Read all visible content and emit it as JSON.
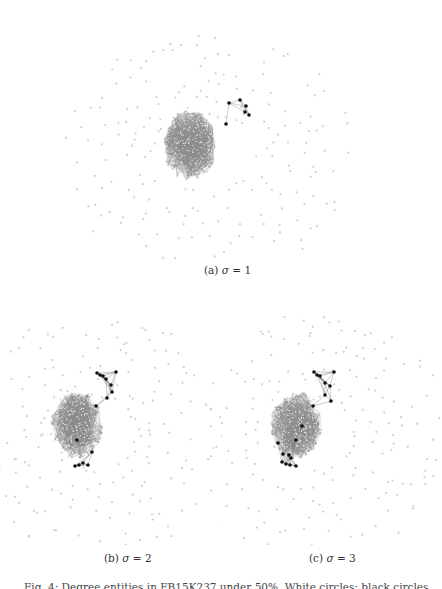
{
  "figure": {
    "caption_partial": "Fig. 4: Degree entities in FB15K237 under 50%. White circles: black circles...",
    "colors": {
      "background": "#ffffff",
      "outer_node": "#cfcfcf",
      "core_edge": "#8a8a8a",
      "core_node": "#f2f2f2",
      "highlight_node": "#111111",
      "highlight_edge": "#555555"
    },
    "panels": [
      {
        "id": "a",
        "label": "(a)",
        "sigma_symbol": "σ",
        "equals": "=",
        "sigma_value": "1",
        "caption_text": "(a) σ = 1",
        "box": {
          "x": 100,
          "y": 0,
          "w": 300,
          "h": 250
        },
        "center": {
          "x": 190,
          "y": 145
        },
        "caption_pos": {
          "x": 204,
          "y": 264
        },
        "highlight_nodes": [
          [
            229,
            103
          ],
          [
            240,
            100
          ],
          [
            246,
            106
          ],
          [
            245,
            112
          ],
          [
            249,
            115
          ],
          [
            226,
            124
          ]
        ]
      },
      {
        "id": "b",
        "label": "(b)",
        "sigma_symbol": "σ",
        "equals": "=",
        "sigma_value": "2",
        "caption_text": "(b) σ = 2",
        "box": {
          "x": 0,
          "y": 290,
          "w": 221,
          "h": 255
        },
        "center": {
          "x": 77,
          "y": 425
        },
        "caption_pos": {
          "x": 104,
          "y": 552
        },
        "highlight_nodes": [
          [
            97,
            373
          ],
          [
            100,
            375
          ],
          [
            103,
            376
          ],
          [
            106,
            379
          ],
          [
            111,
            385
          ],
          [
            116,
            372
          ],
          [
            112,
            392
          ],
          [
            107,
            398
          ],
          [
            96,
            406
          ],
          [
            77,
            440
          ],
          [
            92,
            452
          ],
          [
            88,
            465
          ],
          [
            83,
            463
          ],
          [
            79,
            465
          ],
          [
            75,
            466
          ]
        ]
      },
      {
        "id": "c",
        "label": "(c)",
        "sigma_symbol": "σ",
        "equals": "=",
        "sigma_value": "3",
        "caption_text": "(c) σ = 3",
        "box": {
          "x": 221,
          "y": 290,
          "w": 221,
          "h": 255
        },
        "center": {
          "x": 296,
          "y": 425
        },
        "caption_pos": {
          "x": 309,
          "y": 552
        },
        "highlight_nodes": [
          [
            314,
            372
          ],
          [
            317,
            375
          ],
          [
            320,
            376
          ],
          [
            325,
            383
          ],
          [
            330,
            386
          ],
          [
            334,
            372
          ],
          [
            325,
            395
          ],
          [
            331,
            401
          ],
          [
            313,
            406
          ],
          [
            302,
            426
          ],
          [
            296,
            440
          ],
          [
            278,
            443
          ],
          [
            283,
            454
          ],
          [
            289,
            455
          ],
          [
            291,
            458
          ],
          [
            282,
            462
          ],
          [
            286,
            464
          ],
          [
            290,
            465
          ],
          [
            296,
            466
          ]
        ]
      }
    ]
  }
}
